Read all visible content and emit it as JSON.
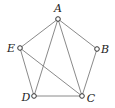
{
  "diagram": {
    "type": "graph",
    "vertices": [
      {
        "id": "A",
        "label": "A",
        "x": 58,
        "y": 19,
        "lx": 58,
        "ly": 12
      },
      {
        "id": "B",
        "label": "B",
        "x": 97,
        "y": 49,
        "lx": 105,
        "ly": 53
      },
      {
        "id": "C",
        "label": "C",
        "x": 82,
        "y": 96,
        "lx": 91,
        "ly": 102
      },
      {
        "id": "D",
        "label": "D",
        "x": 34,
        "y": 96,
        "lx": 26,
        "ly": 101
      },
      {
        "id": "E",
        "label": "E",
        "x": 20,
        "y": 48,
        "lx": 11,
        "ly": 52
      }
    ],
    "edges": [
      [
        "A",
        "B"
      ],
      [
        "B",
        "C"
      ],
      [
        "C",
        "D"
      ],
      [
        "D",
        "E"
      ],
      [
        "E",
        "A"
      ],
      [
        "A",
        "D"
      ],
      [
        "A",
        "C"
      ],
      [
        "E",
        "C"
      ]
    ],
    "colors": {
      "edge": "#8a8a8a",
      "vertex_stroke": "#333333",
      "vertex_fill": "#ffffff",
      "label": "#222222"
    }
  }
}
